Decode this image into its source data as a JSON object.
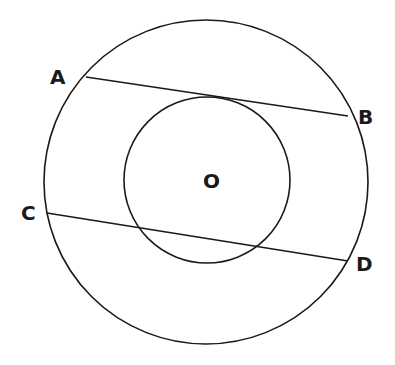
{
  "diagram": {
    "type": "concentric-circles-with-chords",
    "center_label": "O",
    "points": {
      "A": "A",
      "B": "B",
      "C": "C",
      "D": "D"
    },
    "outer_circle": {
      "cx": 206,
      "cy": 182,
      "r": 162
    },
    "inner_circle": {
      "cx": 207,
      "cy": 180,
      "r": 83
    },
    "chords": [
      {
        "name": "AB",
        "x1": 86,
        "y1": 77,
        "x2": 348,
        "y2": 116
      },
      {
        "name": "CD",
        "x1": 47,
        "y1": 213,
        "x2": 348,
        "y2": 261
      }
    ],
    "stroke_color": "#1a1a1a"
  }
}
